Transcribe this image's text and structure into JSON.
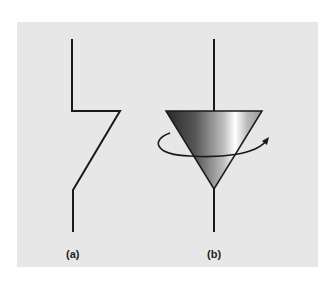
{
  "figure": {
    "panel_background": "#e7e7e7",
    "line_color": "#1a1a1a",
    "labels": {
      "a": "(a)",
      "b": "(b)"
    },
    "diagrams": [
      {
        "id": "a",
        "description": "Stepped bent line symbol (switch/axis representation)"
      },
      {
        "id": "b",
        "description": "Inverted shaded cone on vertical axis with rotation arrow"
      }
    ]
  }
}
